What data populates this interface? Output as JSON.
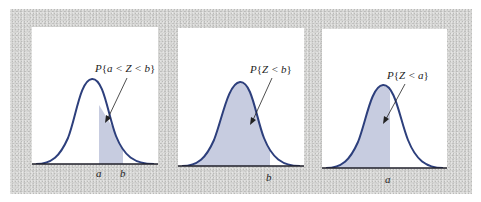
{
  "colors": {
    "frame": "#d4d4d2",
    "panel": "#ffffff",
    "curve": "#2d3f7c",
    "shade": "#c7cce0",
    "axis": "#1f1f2a",
    "text": "#222222"
  },
  "panels": [
    {
      "label_prefix": "P",
      "label_open": "{",
      "label_body": "a < Z < b",
      "label_close": "}",
      "axis_labels": [
        "a",
        "b"
      ],
      "shaded_region": "between a and b"
    },
    {
      "label_prefix": "P",
      "label_open": "{",
      "label_body": "Z < b",
      "label_close": "}",
      "axis_labels": [
        "b"
      ],
      "shaded_region": "left of b"
    },
    {
      "label_prefix": "P",
      "label_open": "{",
      "label_body": "Z < a",
      "label_close": "}",
      "axis_labels": [
        "a"
      ],
      "shaded_region": "left of a"
    }
  ]
}
